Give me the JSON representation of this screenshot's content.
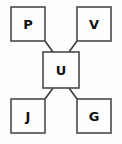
{
  "diagram": {
    "type": "node-link-graph",
    "layout": "star",
    "canvas": {
      "width": 122,
      "height": 144
    },
    "colors": {
      "background": "#fdfdfd",
      "node_fill": "#fefefe",
      "node_stroke": "#4a4a4a",
      "edge_stroke": "#3a3a3a",
      "label_color": "#111111"
    },
    "nodes": [
      {
        "id": "p",
        "label": "P",
        "position": "top-left",
        "x": 11,
        "y": 7,
        "w": 34,
        "h": 34,
        "cx": 28,
        "cy": 24
      },
      {
        "id": "v",
        "label": "V",
        "position": "top-right",
        "x": 77,
        "y": 7,
        "w": 34,
        "h": 34,
        "cx": 94,
        "cy": 24
      },
      {
        "id": "u",
        "label": "U",
        "position": "center",
        "x": 43,
        "y": 52,
        "w": 36,
        "h": 36,
        "cx": 61,
        "cy": 70
      },
      {
        "id": "j",
        "label": "J",
        "position": "bottom-left",
        "x": 11,
        "y": 99,
        "w": 34,
        "h": 34,
        "cx": 28,
        "cy": 116
      },
      {
        "id": "g",
        "label": "G",
        "position": "bottom-right",
        "x": 77,
        "y": 99,
        "w": 34,
        "h": 34,
        "cx": 94,
        "cy": 116
      }
    ],
    "edges": [
      {
        "id": "p-u",
        "from": "P",
        "to": "U",
        "x1": 45,
        "y1": 41,
        "x2": 53,
        "y2": 52
      },
      {
        "id": "v-u",
        "from": "V",
        "to": "U",
        "x1": 77,
        "y1": 41,
        "x2": 69,
        "y2": 52
      },
      {
        "id": "j-u",
        "from": "J",
        "to": "U",
        "x1": 45,
        "y1": 99,
        "x2": 53,
        "y2": 88
      },
      {
        "id": "g-u",
        "from": "G",
        "to": "U",
        "x1": 77,
        "y1": 99,
        "x2": 69,
        "y2": 88
      }
    ]
  }
}
